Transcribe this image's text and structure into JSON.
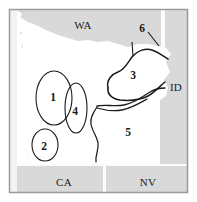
{
  "figure": {
    "type": "map",
    "background_color": "#ffffff",
    "land_fill": "#ffffff",
    "neighbor_fill": "#d9d9d9",
    "outline_color": "#1a1a1a",
    "frame_color": "#9a9a9a"
  },
  "state_labels": [
    {
      "id": "wa",
      "text": "WA",
      "x": 83,
      "y": 29
    },
    {
      "id": "id",
      "text": "ID",
      "x": 176,
      "y": 91
    },
    {
      "id": "ca",
      "text": "CA",
      "x": 64,
      "y": 186
    },
    {
      "id": "nv",
      "text": "NV",
      "x": 148,
      "y": 186
    }
  ],
  "region_numbers": [
    {
      "id": "region-1",
      "text": "1",
      "x": 53,
      "y": 101
    },
    {
      "id": "region-2",
      "text": "2",
      "x": 44,
      "y": 146
    },
    {
      "id": "region-3",
      "text": "3",
      "x": 133,
      "y": 75
    },
    {
      "id": "region-4",
      "text": "4",
      "x": 75,
      "y": 111
    },
    {
      "id": "region-5",
      "text": "5",
      "x": 128,
      "y": 132
    },
    {
      "id": "region-6",
      "text": "6",
      "x": 142,
      "y": 28
    }
  ],
  "ellipses": [
    {
      "id": "ellipse-1",
      "cx": 54,
      "cy": 98,
      "rx": 18,
      "ry": 27,
      "rotation": 0
    },
    {
      "id": "ellipse-2",
      "cx": 45,
      "cy": 145,
      "rx": 13,
      "ry": 16,
      "rotation": 0
    },
    {
      "id": "ellipse-4",
      "cx": 76,
      "cy": 108,
      "rx": 11,
      "ry": 25,
      "rotation": 0
    }
  ],
  "leader_lines": [
    {
      "id": "leader-6",
      "from_x": 148,
      "from_y": 32,
      "to_x": 159,
      "to_y": 45
    },
    {
      "id": "tick-6",
      "from_x": 132,
      "from_y": 42,
      "to_x": 133,
      "to_y": 56
    }
  ]
}
